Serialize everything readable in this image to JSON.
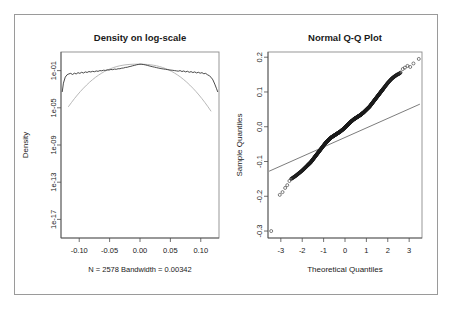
{
  "figure": {
    "width": 451,
    "height": 310,
    "background": "#ffffff",
    "border_color": "#9a9a9a"
  },
  "chart_data": [
    {
      "type": "line",
      "id": "density-log-scale",
      "title": "Density on log-scale",
      "xlabel": "",
      "ylabel": "Density",
      "subtitle": "N = 2578   Bandwidth = 0.00342",
      "n": 2578,
      "bandwidth": 0.00342,
      "grid": false,
      "legend": "none",
      "xlim": [
        -0.13,
        0.13
      ],
      "ylim_exponent": [
        -19,
        1
      ],
      "xticks": [
        -0.1,
        -0.05,
        0.0,
        0.05,
        0.1
      ],
      "xticklabels": [
        "-0.10",
        "-0.05",
        "0.00",
        "0.05",
        "0.10"
      ],
      "yticks_exponent": [
        -1,
        -5,
        -9,
        -13,
        -17
      ],
      "yticklabels": [
        "1e-01",
        "1e-05",
        "1e-09",
        "1e-13",
        "1e-17"
      ],
      "series": [
        {
          "name": "empirical density",
          "color": "#2b2b2b",
          "x": [
            -0.128,
            -0.126,
            -0.123,
            -0.12,
            -0.117,
            -0.114,
            -0.111,
            -0.108,
            -0.105,
            -0.102,
            -0.099,
            -0.096,
            -0.093,
            -0.09,
            -0.087,
            -0.084,
            -0.081,
            -0.078,
            -0.075,
            -0.072,
            -0.069,
            -0.066,
            -0.063,
            -0.06,
            -0.057,
            -0.054,
            -0.051,
            -0.048,
            -0.045,
            -0.042,
            -0.039,
            -0.036,
            -0.033,
            -0.03,
            -0.027,
            -0.024,
            -0.021,
            -0.018,
            -0.015,
            -0.012,
            -0.009,
            -0.006,
            -0.003,
            0.0,
            0.003,
            0.006,
            0.009,
            0.012,
            0.015,
            0.018,
            0.021,
            0.024,
            0.027,
            0.03,
            0.033,
            0.036,
            0.039,
            0.042,
            0.045,
            0.048,
            0.051,
            0.054,
            0.057,
            0.06,
            0.063,
            0.066,
            0.069,
            0.072,
            0.075,
            0.078,
            0.081,
            0.084,
            0.087,
            0.09,
            0.093,
            0.096,
            0.099,
            0.102,
            0.105,
            0.108,
            0.111,
            0.114,
            0.117,
            0.12,
            0.123,
            0.126,
            0.128
          ],
          "log10y": [
            -3.3,
            -2.35,
            -1.7,
            -1.45,
            -1.35,
            -1.3,
            -1.42,
            -1.28,
            -1.36,
            -1.22,
            -1.3,
            -1.18,
            -1.26,
            -1.14,
            -1.2,
            -1.1,
            -1.15,
            -1.08,
            -1.12,
            -1.04,
            -1.08,
            -1.0,
            -1.02,
            -0.96,
            -0.98,
            -0.92,
            -0.94,
            -0.88,
            -0.9,
            -0.84,
            -0.86,
            -0.8,
            -0.8,
            -0.74,
            -0.72,
            -0.66,
            -0.64,
            -0.58,
            -0.54,
            -0.48,
            -0.44,
            -0.38,
            -0.34,
            -0.31,
            -0.32,
            -0.35,
            -0.39,
            -0.44,
            -0.49,
            -0.54,
            -0.59,
            -0.63,
            -0.68,
            -0.72,
            -0.76,
            -0.8,
            -0.83,
            -0.86,
            -0.89,
            -0.92,
            -0.95,
            -0.97,
            -1.0,
            -1.03,
            -1.06,
            -1.0,
            -1.1,
            -1.04,
            -1.14,
            -1.07,
            -1.18,
            -1.11,
            -1.21,
            -1.14,
            -1.25,
            -1.18,
            -1.28,
            -1.22,
            -1.34,
            -1.3,
            -1.44,
            -1.55,
            -1.72,
            -2.0,
            -2.45,
            -2.95,
            -3.3
          ]
        },
        {
          "name": "normal reference",
          "color": "#b0b0b0",
          "x": [
            -0.118,
            -0.113,
            -0.108,
            -0.103,
            -0.098,
            -0.093,
            -0.088,
            -0.083,
            -0.078,
            -0.073,
            -0.068,
            -0.063,
            -0.058,
            -0.053,
            -0.048,
            -0.043,
            -0.038,
            -0.033,
            -0.028,
            -0.023,
            -0.018,
            -0.013,
            -0.008,
            -0.003,
            0.002,
            0.007,
            0.012,
            0.017,
            0.022,
            0.027,
            0.032,
            0.037,
            0.042,
            0.047,
            0.052,
            0.057,
            0.062,
            0.067,
            0.072,
            0.077,
            0.082,
            0.087,
            0.092,
            0.097,
            0.102,
            0.107,
            0.112,
            0.117
          ],
          "log10y": [
            -4.9,
            -4.45,
            -4.02,
            -3.62,
            -3.24,
            -2.89,
            -2.56,
            -2.25,
            -1.97,
            -1.71,
            -1.48,
            -1.27,
            -1.08,
            -0.92,
            -0.78,
            -0.66,
            -0.56,
            -0.48,
            -0.42,
            -0.37,
            -0.34,
            -0.32,
            -0.31,
            -0.31,
            -0.31,
            -0.32,
            -0.34,
            -0.37,
            -0.42,
            -0.48,
            -0.56,
            -0.66,
            -0.78,
            -0.92,
            -1.08,
            -1.27,
            -1.48,
            -1.71,
            -1.97,
            -2.25,
            -2.56,
            -2.89,
            -3.24,
            -3.62,
            -4.02,
            -4.45,
            -4.9,
            -5.38
          ]
        }
      ]
    },
    {
      "type": "scatter",
      "id": "normal-qq-plot",
      "title": "Normal Q-Q Plot",
      "xlabel": "Theoretical Quantiles",
      "ylabel": "Sample Quantiles",
      "grid": false,
      "legend": "none",
      "xlim": [
        -3.6,
        3.6
      ],
      "ylim": [
        -0.32,
        0.215
      ],
      "xticks": [
        -3,
        -2,
        -1,
        0,
        1,
        2,
        3
      ],
      "xticklabels": [
        "-3",
        "-2",
        "-1",
        "0",
        "1",
        "2",
        "3"
      ],
      "yticks": [
        0.2,
        0.1,
        0.0,
        -0.1,
        -0.2,
        -0.3
      ],
      "yticklabels": [
        "0.2",
        "0.1",
        "0.0",
        "-0.1",
        "-0.2",
        "-0.3"
      ],
      "reference_line": {
        "name": "qqline",
        "color": "#5a5a5a",
        "x": [
          -3.55,
          3.5
        ],
        "y": [
          -0.128,
          0.065
        ]
      },
      "points": {
        "name": "sample quantiles",
        "marker": "open-circle",
        "color": "#1a1a1a",
        "x": [
          -3.45,
          -3.05,
          -2.92,
          -2.8,
          -2.7,
          -2.6,
          -2.52,
          -2.44,
          -2.37,
          -2.3,
          -2.24,
          -2.18,
          -2.12,
          -2.06,
          -2.0,
          -1.95,
          -1.9,
          -1.85,
          -1.8,
          -1.75,
          -1.7,
          -1.65,
          -1.6,
          -1.55,
          -1.5,
          -1.45,
          -1.4,
          -1.35,
          -1.3,
          -1.25,
          -1.2,
          -1.15,
          -1.1,
          -1.05,
          -1.0,
          -0.95,
          -0.9,
          -0.85,
          -0.8,
          -0.75,
          -0.7,
          -0.65,
          -0.6,
          -0.55,
          -0.5,
          -0.45,
          -0.4,
          -0.35,
          -0.3,
          -0.25,
          -0.2,
          -0.15,
          -0.1,
          -0.05,
          0.0,
          0.05,
          0.1,
          0.15,
          0.2,
          0.25,
          0.3,
          0.35,
          0.4,
          0.45,
          0.5,
          0.55,
          0.6,
          0.65,
          0.7,
          0.75,
          0.8,
          0.85,
          0.9,
          0.95,
          1.0,
          1.05,
          1.1,
          1.15,
          1.2,
          1.25,
          1.3,
          1.35,
          1.4,
          1.45,
          1.5,
          1.55,
          1.6,
          1.65,
          1.7,
          1.75,
          1.8,
          1.85,
          1.9,
          1.95,
          2.0,
          2.06,
          2.12,
          2.18,
          2.24,
          2.3,
          2.37,
          2.44,
          2.52,
          2.6,
          2.7,
          2.8,
          2.92,
          3.05,
          3.2,
          3.45
        ],
        "y": [
          -0.3,
          -0.196,
          -0.188,
          -0.176,
          -0.168,
          -0.156,
          -0.15,
          -0.147,
          -0.144,
          -0.141,
          -0.138,
          -0.135,
          -0.132,
          -0.129,
          -0.126,
          -0.123,
          -0.12,
          -0.117,
          -0.114,
          -0.111,
          -0.108,
          -0.105,
          -0.102,
          -0.098,
          -0.094,
          -0.09,
          -0.086,
          -0.082,
          -0.078,
          -0.074,
          -0.07,
          -0.066,
          -0.062,
          -0.058,
          -0.054,
          -0.05,
          -0.046,
          -0.043,
          -0.04,
          -0.037,
          -0.034,
          -0.031,
          -0.029,
          -0.027,
          -0.025,
          -0.023,
          -0.021,
          -0.019,
          -0.017,
          -0.015,
          -0.013,
          -0.01,
          -0.008,
          -0.005,
          -0.002,
          0.001,
          0.004,
          0.007,
          0.01,
          0.013,
          0.016,
          0.018,
          0.021,
          0.023,
          0.025,
          0.027,
          0.029,
          0.031,
          0.033,
          0.035,
          0.038,
          0.04,
          0.043,
          0.046,
          0.049,
          0.052,
          0.055,
          0.058,
          0.062,
          0.066,
          0.07,
          0.074,
          0.078,
          0.082,
          0.086,
          0.09,
          0.094,
          0.098,
          0.102,
          0.106,
          0.11,
          0.114,
          0.118,
          0.122,
          0.126,
          0.13,
          0.134,
          0.138,
          0.141,
          0.144,
          0.147,
          0.15,
          0.152,
          0.156,
          0.166,
          0.17,
          0.175,
          0.172,
          0.182,
          0.195
        ]
      }
    }
  ]
}
